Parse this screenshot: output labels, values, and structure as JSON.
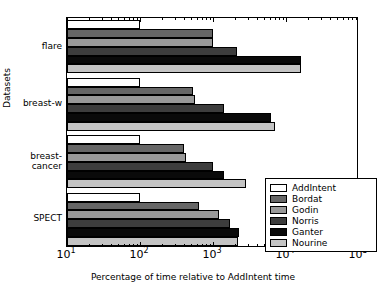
{
  "chart_data": {
    "type": "bar",
    "orientation": "horizontal",
    "title": "",
    "xlabel": "Percentage of time relative to AddIntent time",
    "ylabel": "Datasets",
    "xscale": "log",
    "xlim": [
      10,
      100000
    ],
    "xticks": [
      10,
      100,
      1000,
      10000,
      100000
    ],
    "xticklabels": [
      "10¹",
      "10²",
      "10³",
      "10⁴",
      "10⁵"
    ],
    "xtick_mantissas": [
      "10",
      "10",
      "10",
      "10",
      "10"
    ],
    "xtick_exponents": [
      "1",
      "2",
      "3",
      "4",
      "5"
    ],
    "grid": false,
    "legend_position": "lower right",
    "categories": [
      "SPECT",
      "breast-cancer",
      "breast-w",
      "flare"
    ],
    "category_labels": [
      "SPECT",
      "breast-\ncancer",
      "breast-w",
      "flare"
    ],
    "series": [
      {
        "name": "AddIntent",
        "color": "#ffffff",
        "values": [
          100,
          100,
          100,
          100
        ]
      },
      {
        "name": "Bordat",
        "color": "#666666",
        "values": [
          650,
          400,
          530,
          1000
        ]
      },
      {
        "name": "Godin",
        "color": "#999999",
        "values": [
          1200,
          420,
          560,
          1000
        ]
      },
      {
        "name": "Norris",
        "color": "#3d3d3d",
        "values": [
          1700,
          1000,
          1400,
          2100
        ]
      },
      {
        "name": "Ganter",
        "color": "#0a0a0a",
        "values": [
          2300,
          1400,
          6300,
          16000
        ]
      },
      {
        "name": "Nourine",
        "color": "#c4c4c4",
        "values": [
          2200,
          2800,
          7000,
          16000
        ]
      }
    ]
  },
  "legend": {
    "items": [
      {
        "label": "AddIntent",
        "color": "#ffffff"
      },
      {
        "label": "Bordat",
        "color": "#666666"
      },
      {
        "label": "Godin",
        "color": "#999999"
      },
      {
        "label": "Norris",
        "color": "#3d3d3d"
      },
      {
        "label": "Ganter",
        "color": "#0a0a0a"
      },
      {
        "label": "Nourine",
        "color": "#c4c4c4"
      }
    ]
  }
}
